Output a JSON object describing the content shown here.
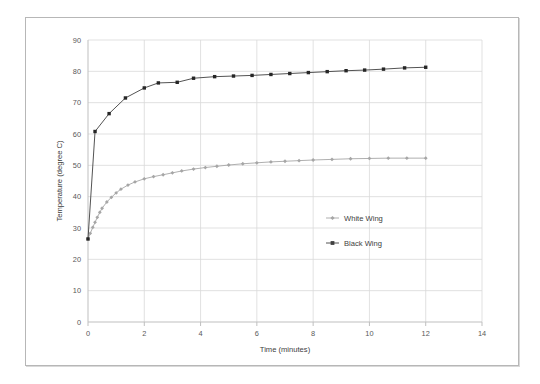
{
  "figure": {
    "background": "#ffffff",
    "frame_color": "#b7b7b7"
  },
  "chart_data": {
    "type": "line",
    "title": "",
    "xlabel": "Time (minutes)",
    "ylabel": "Temperature (degree C)",
    "xlim": [
      0,
      14
    ],
    "ylim": [
      0,
      90
    ],
    "xticks": [
      0,
      2,
      4,
      6,
      8,
      10,
      12,
      14
    ],
    "xtick_labels": [
      "0",
      "2",
      "4",
      "6",
      "8",
      "10",
      "12",
      "14"
    ],
    "yticks": [
      0,
      10,
      20,
      30,
      40,
      50,
      60,
      70,
      80,
      90
    ],
    "ytick_labels": [
      "0",
      "10",
      "20",
      "30",
      "40",
      "50",
      "60",
      "70",
      "80",
      "90"
    ],
    "grid": true,
    "grid_color": "#d9d9d9",
    "legend_position": "center",
    "series": [
      {
        "name": "White Wing",
        "color": "#a6a6a6",
        "marker": "diamond",
        "marker_color": "#a6a6a6",
        "x": [
          0,
          0.08,
          0.17,
          0.25,
          0.33,
          0.42,
          0.5,
          0.67,
          0.83,
          1.0,
          1.17,
          1.42,
          1.67,
          2.0,
          2.33,
          2.67,
          3.0,
          3.33,
          3.75,
          4.17,
          4.58,
          5.0,
          5.5,
          6.0,
          6.5,
          7.0,
          7.5,
          8.0,
          8.67,
          9.33,
          10.0,
          10.67,
          11.33,
          12.0
        ],
        "y": [
          26.5,
          28.3,
          30.2,
          31.8,
          33.4,
          35.0,
          36.3,
          38.3,
          39.8,
          41.2,
          42.4,
          43.7,
          44.7,
          45.7,
          46.4,
          47.0,
          47.6,
          48.2,
          48.8,
          49.3,
          49.7,
          50.1,
          50.5,
          50.8,
          51.1,
          51.3,
          51.5,
          51.7,
          51.9,
          52.1,
          52.2,
          52.3,
          52.3,
          52.3
        ]
      },
      {
        "name": "Black Wing",
        "color": "#404040",
        "marker": "square",
        "marker_color": "#262626",
        "x": [
          0,
          0.25,
          0.75,
          1.33,
          2.0,
          2.5,
          3.17,
          3.75,
          4.5,
          5.17,
          5.83,
          6.5,
          7.17,
          7.83,
          8.5,
          9.17,
          9.83,
          10.5,
          11.25,
          12.0
        ],
        "y": [
          26.5,
          60.8,
          66.5,
          71.5,
          74.7,
          76.3,
          76.5,
          77.8,
          78.3,
          78.5,
          78.7,
          79.0,
          79.3,
          79.6,
          79.9,
          80.2,
          80.4,
          80.7,
          81.1,
          81.3
        ]
      }
    ],
    "legend_entries": [
      {
        "label": "White Wing",
        "color": "#a6a6a6",
        "marker": "diamond"
      },
      {
        "label": "Black Wing",
        "color": "#404040",
        "marker": "square"
      }
    ]
  }
}
